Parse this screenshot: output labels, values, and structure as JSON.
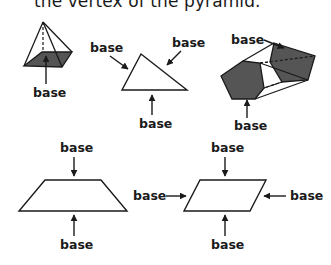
{
  "caption": "the vertex of the pyramid.",
  "colors": {
    "shaded_base": "#555555",
    "stroke": "#1a1a1a",
    "background": "#ffffff"
  },
  "figures": [
    {
      "name": "pyramid",
      "labels": [
        "base"
      ]
    },
    {
      "name": "triangle",
      "labels": [
        "base",
        "base",
        "base"
      ]
    },
    {
      "name": "pentagonal-prism",
      "labels": [
        "base",
        "base"
      ]
    },
    {
      "name": "trapezoid",
      "labels": [
        "base",
        "base"
      ]
    },
    {
      "name": "parallelogram",
      "labels": [
        "base",
        "base",
        "base",
        "base"
      ]
    }
  ],
  "labels": {
    "pyramid_bottom": "base",
    "triangle_left": "base",
    "triangle_right": "base",
    "triangle_bottom": "base",
    "prism_top": "base",
    "prism_bottom": "base",
    "trapezoid_top": "base",
    "trapezoid_bottom": "base",
    "parallelogram_top": "base",
    "parallelogram_left": "base",
    "parallelogram_right": "base",
    "parallelogram_bottom": "base"
  }
}
